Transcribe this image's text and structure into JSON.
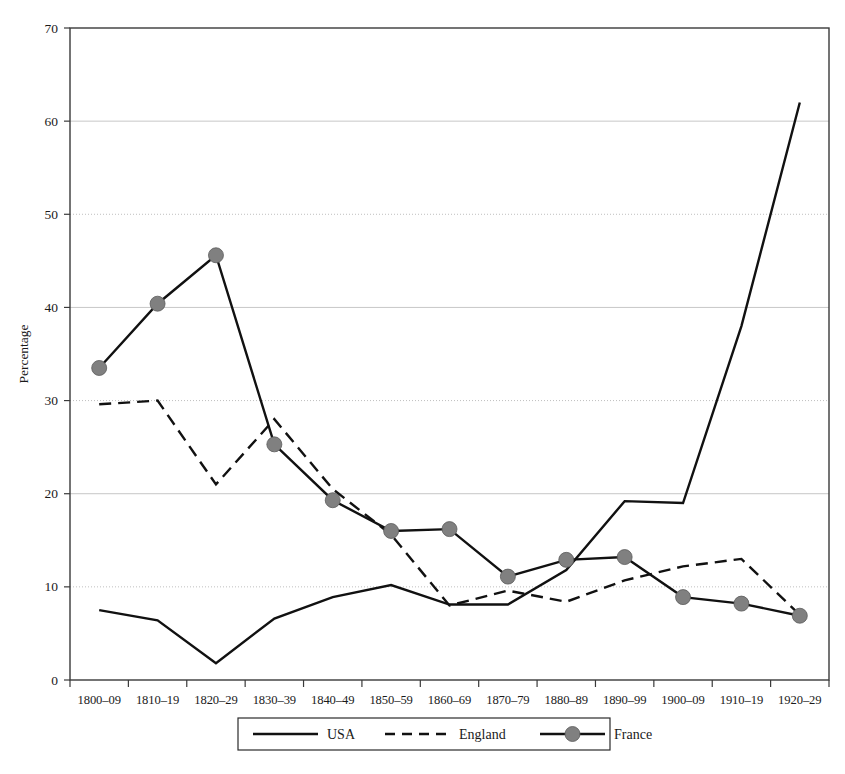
{
  "chart_data": {
    "type": "line",
    "title": "",
    "xlabel": "",
    "ylabel": "Percentage",
    "ylim": [
      0,
      70
    ],
    "ytick_step": 10,
    "grid": true,
    "grid_axis": "y",
    "legend_position": "bottom",
    "categories": [
      "1800–09",
      "1810–19",
      "1820–29",
      "1830–39",
      "1840–49",
      "1850–59",
      "1860–69",
      "1870–79",
      "1880–89",
      "1890–99",
      "1900–09",
      "1910–19",
      "1920–29"
    ],
    "yticks": [
      0,
      10,
      20,
      30,
      40,
      50,
      60,
      70
    ],
    "series": [
      {
        "name": "USA",
        "style": "solid",
        "marker": "none",
        "color": "#111111",
        "values": [
          7.5,
          6.4,
          1.8,
          6.6,
          8.9,
          10.2,
          8.1,
          8.1,
          11.8,
          19.2,
          19.0,
          38.0,
          62.0
        ]
      },
      {
        "name": "England",
        "style": "dashed",
        "marker": "none",
        "color": "#111111",
        "values": [
          29.6,
          30.0,
          21.0,
          28.0,
          20.5,
          15.6,
          8.0,
          9.6,
          8.4,
          10.7,
          12.2,
          13.0,
          7.0
        ]
      },
      {
        "name": "France",
        "style": "solid",
        "marker": "circle",
        "color": "#111111",
        "marker_color": "#808080",
        "values": [
          33.5,
          40.4,
          45.6,
          25.3,
          19.3,
          16.0,
          16.2,
          11.1,
          12.9,
          13.2,
          8.9,
          8.2,
          6.9
        ]
      }
    ]
  },
  "legend": {
    "items": [
      {
        "label": "USA",
        "style": "solid",
        "marker": "none"
      },
      {
        "label": "England",
        "style": "dashed",
        "marker": "none"
      },
      {
        "label": "France",
        "style": "solid",
        "marker": "circle"
      }
    ]
  },
  "colors": {
    "line": "#111111",
    "marker_fill": "#808080",
    "marker_stroke": "#5a5a5a",
    "frame": "#3a3a3a",
    "gridline": "#b8b8b8",
    "background": "#ffffff",
    "text": "#1a1a1a"
  }
}
